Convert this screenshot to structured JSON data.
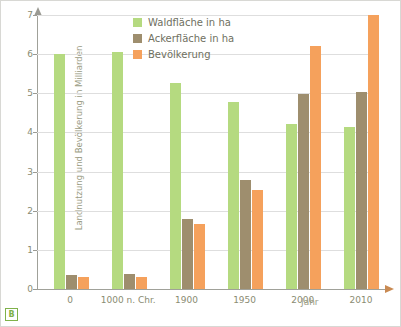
{
  "chart_data": {
    "type": "bar",
    "title": "",
    "xlabel": "Jahr",
    "ylabel": "Landnutzung und Bevölkerung in Milliarden",
    "categories": [
      "0",
      "1000 n. Chr.",
      "1900",
      "1950",
      "2000",
      "2010"
    ],
    "series": [
      {
        "name": "Waldfläche in ha",
        "color": "#b5da80",
        "values": [
          6.0,
          6.05,
          5.27,
          4.78,
          4.22,
          4.13
        ]
      },
      {
        "name": "Ackerfläche in ha",
        "color": "#9e8e6e",
        "values": [
          0.35,
          0.38,
          1.8,
          2.78,
          4.98,
          5.03
        ]
      },
      {
        "name": "Bevölkerung",
        "color": "#f5a15c",
        "values": [
          0.3,
          0.31,
          1.65,
          2.52,
          6.2,
          7.0
        ]
      }
    ],
    "ylim": [
      0,
      7
    ],
    "yticks": [
      "0",
      "1",
      "2",
      "3",
      "4",
      "5",
      "6",
      "7"
    ],
    "grid": true,
    "legend_position": "top-center"
  },
  "legend": {
    "items": [
      {
        "label": "Waldfläche in ha",
        "color": "#b5da80"
      },
      {
        "label": "Ackerfläche in ha",
        "color": "#9e8e6e"
      },
      {
        "label": "Bevölkerung",
        "color": "#f5a15c"
      }
    ]
  },
  "badge": {
    "text": "B",
    "color": "#7fb24a"
  }
}
